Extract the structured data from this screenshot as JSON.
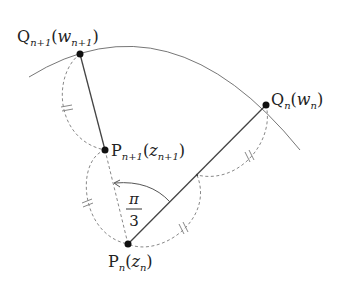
{
  "diagram": {
    "points": {
      "Qn1": {
        "x": 80,
        "y": 54,
        "label_main": "Q",
        "label_sub": "n+1",
        "label_arg": "w",
        "label_argsub": "n+1"
      },
      "Pn1": {
        "x": 105,
        "y": 150,
        "label_main": "P",
        "label_sub": "n+1",
        "label_arg": "z",
        "label_argsub": "n+1"
      },
      "Qn": {
        "x": 266,
        "y": 105,
        "label_main": "Q",
        "label_sub": "n",
        "label_arg": "w",
        "label_argsub": "n"
      },
      "Pn": {
        "x": 128,
        "y": 244,
        "label_main": "P",
        "label_sub": "n",
        "label_arg": "z",
        "label_argsub": "n"
      },
      "M": {
        "x": 197,
        "y": 175
      }
    },
    "angle_label": {
      "numerator": "π",
      "denominator": "3"
    },
    "colors": {
      "line": "#444444",
      "dashed": "#888888",
      "point": "#111111",
      "curve": "#777777"
    }
  }
}
